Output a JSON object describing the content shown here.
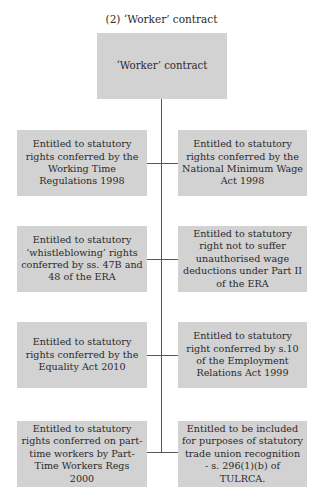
{
  "caption": "(2) ‘Worker’ contract",
  "root": {
    "label": "‘Worker’ contract"
  },
  "left": [
    {
      "label": "Entitled to statutory rights conferred by the Working Time Regulations 1998"
    },
    {
      "label": "Entitled to statutory ‘whistleblowing’ rights conferred by ss. 47B and 48 of the ERA"
    },
    {
      "label": "Entitled to statutory rights conferred by the Equality Act 2010"
    },
    {
      "label": "Entitled to statutory rights conferred on part-time workers by Part-Time Workers Regs 2000"
    }
  ],
  "right": [
    {
      "label": "Entitled to statutory rights conferred by the National Minimum Wage Act 1998"
    },
    {
      "label": "Entitled to statutory right not to suffer unauthorised wage deductions under Part II of the ERA"
    },
    {
      "label": "Entitled to statutory right conferred by s.10 of the Employment Relations Act 1999"
    },
    {
      "label": "Entitled to be included for purposes of statutory trade union recognition - s. 296(1)(b) of TULRCA."
    }
  ],
  "colors": {
    "box_fill": "#d2d2d2",
    "connector": "#555555",
    "text": "#2a2a2a"
  }
}
